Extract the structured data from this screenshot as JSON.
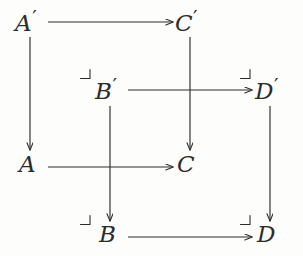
{
  "figure": {
    "kind": "commutative-diagram",
    "background_color": "#fdfdfc",
    "ink_color": "#2c2c2c"
  },
  "nodes": [
    {
      "id": "Ap",
      "base": "A",
      "prime": "′",
      "label": "A′",
      "x": 30,
      "y": 22
    },
    {
      "id": "Cp",
      "base": "C",
      "prime": "′",
      "label": "C′",
      "x": 190,
      "y": 22
    },
    {
      "id": "Bp",
      "base": "B",
      "prime": "′",
      "label": "B′",
      "x": 110,
      "y": 90
    },
    {
      "id": "Dp",
      "base": "D",
      "prime": "′",
      "label": "D′",
      "x": 270,
      "y": 90
    },
    {
      "id": "A",
      "base": "A",
      "prime": "",
      "label": "A",
      "x": 30,
      "y": 167
    },
    {
      "id": "C",
      "base": "C",
      "prime": "",
      "label": "C",
      "x": 190,
      "y": 167
    },
    {
      "id": "B",
      "base": "B",
      "prime": "",
      "label": "B",
      "x": 110,
      "y": 237
    },
    {
      "id": "D",
      "base": "D",
      "prime": "",
      "label": "D",
      "x": 270,
      "y": 237
    }
  ],
  "arrows": [
    {
      "id": "Ap-to-Cp",
      "from": "A′",
      "to": "C′",
      "orientation": "horizontal",
      "x1": 48,
      "y1": 22,
      "x2": 173,
      "y2": 22,
      "label": ""
    },
    {
      "id": "Bp-to-Dp",
      "from": "B′",
      "to": "D′",
      "orientation": "horizontal",
      "x1": 128,
      "y1": 90,
      "x2": 252,
      "y2": 90,
      "label": ""
    },
    {
      "id": "A-to-C",
      "from": "A",
      "to": "C",
      "orientation": "horizontal",
      "x1": 48,
      "y1": 167,
      "x2": 173,
      "y2": 167,
      "label": ""
    },
    {
      "id": "B-to-D",
      "from": "B",
      "to": "D",
      "orientation": "horizontal",
      "x1": 128,
      "y1": 237,
      "x2": 252,
      "y2": 237,
      "label": ""
    },
    {
      "id": "Ap-to-A",
      "from": "A′",
      "to": "A",
      "orientation": "vertical",
      "x1": 30,
      "y1": 37,
      "x2": 30,
      "y2": 150,
      "label": ""
    },
    {
      "id": "Cp-to-C",
      "from": "C′",
      "to": "C",
      "orientation": "vertical",
      "x1": 190,
      "y1": 37,
      "x2": 190,
      "y2": 150,
      "label": ""
    },
    {
      "id": "Bp-to-B",
      "from": "B′",
      "to": "B",
      "orientation": "vertical",
      "x1": 110,
      "y1": 106,
      "x2": 110,
      "y2": 221,
      "label": ""
    },
    {
      "id": "Dp-to-D",
      "from": "D′",
      "to": "D",
      "orientation": "vertical",
      "x1": 270,
      "y1": 106,
      "x2": 270,
      "y2": 221,
      "label": ""
    }
  ],
  "corner_marks": [
    {
      "id": "corner-near-Bp",
      "near": "B′",
      "x": 86,
      "y": 73
    },
    {
      "id": "corner-near-Dp",
      "near": "D′",
      "x": 246,
      "y": 73
    },
    {
      "id": "corner-near-B",
      "near": "B",
      "x": 86,
      "y": 219
    },
    {
      "id": "corner-near-D",
      "near": "D",
      "x": 246,
      "y": 219
    }
  ],
  "crossings": [
    {
      "id": "crossing-Bp-Dp-over-Cp-C",
      "x": 190,
      "y": 90
    },
    {
      "id": "crossing-A-C-over-Bp-B",
      "x": 110,
      "y": 167
    }
  ]
}
